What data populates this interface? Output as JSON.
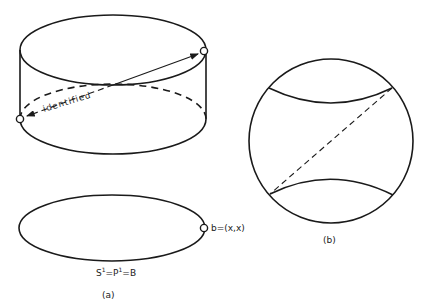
{
  "figure_a": {
    "arrow_label": "identified",
    "point_label": "b=(x,x)",
    "base_label_S": "S",
    "base_label_sup1": "1",
    "base_label_eq1": "=P",
    "base_label_sup2": "1",
    "base_label_eq2": "=B",
    "caption": "(a)"
  },
  "figure_b": {
    "caption": "(b)"
  },
  "colors": {
    "ink": "#1a1a1a",
    "background": "#ffffff"
  }
}
